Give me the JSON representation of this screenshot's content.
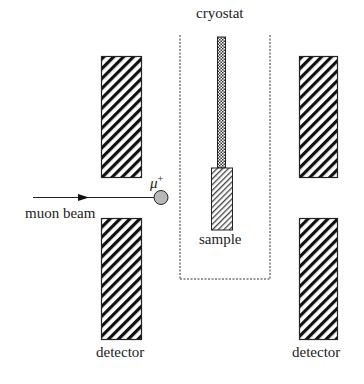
{
  "labels": {
    "cryostat": "cryostat",
    "muon_beam": "muon beam",
    "muon": "μ",
    "muon_charge": "+",
    "sample": "sample",
    "detector_left": "detector",
    "detector_right": "detector"
  },
  "colors": {
    "line": "#222222",
    "muon_fill": "#b8b8b8"
  }
}
